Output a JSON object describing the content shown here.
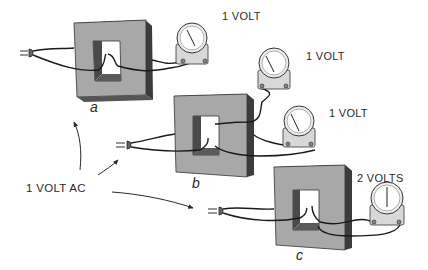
{
  "diagram": {
    "source_label": "1 VOLT AC",
    "colors": {
      "core_face": "#a8a8a8",
      "core_side": "#3c3c3c",
      "core_top": "#2e2e2e",
      "window_dark": "#4a4a4a",
      "meter_body": "#d8d8d8",
      "wire": "#1a1a1a"
    },
    "setups": [
      {
        "id": "a",
        "label": "a",
        "meter_readings": [
          "1 VOLT"
        ]
      },
      {
        "id": "b",
        "label": "b",
        "meter_readings": [
          "1 VOLT",
          "1 VOLT"
        ]
      },
      {
        "id": "c",
        "label": "c",
        "meter_readings": [
          "2 VOLTS"
        ]
      }
    ]
  }
}
